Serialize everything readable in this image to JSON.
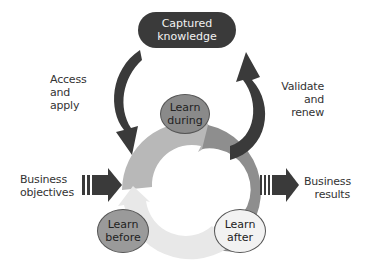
{
  "diagram": {
    "top_box": {
      "line1": "Captured",
      "line2": "knowledge"
    },
    "left_arrow_label": {
      "line1": "Access",
      "line2": "and",
      "line3": "apply"
    },
    "right_arrow_label": {
      "line1": "Validate",
      "line2": "and",
      "line3": "renew"
    },
    "input_label": {
      "line1": "Business",
      "line2": "objectives"
    },
    "output_label": {
      "line1": "Business",
      "line2": "results"
    },
    "nodes": [
      {
        "id": "during",
        "line1": "Learn",
        "line2": "during",
        "color": "#8a8a8a"
      },
      {
        "id": "before",
        "line1": "Learn",
        "line2": "before",
        "color": "#9a9a9a"
      },
      {
        "id": "after",
        "line1": "Learn",
        "line2": "after",
        "color": "#f2f2f2"
      }
    ],
    "colors": {
      "dark": "#3a3a3a",
      "cycle_top": "#b5b5b5",
      "cycle_right": "#8c8c8c",
      "cycle_bottom": "#e6e6e6"
    }
  }
}
